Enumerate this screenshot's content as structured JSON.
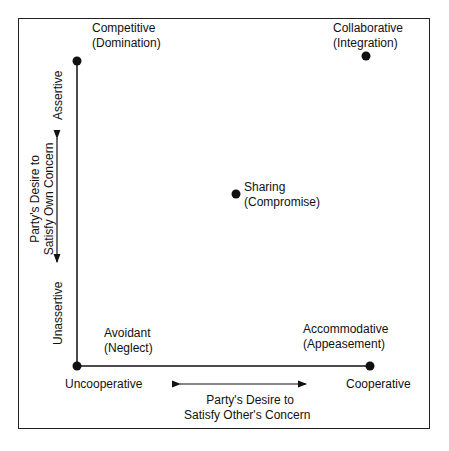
{
  "diagram": {
    "styles": [
      {
        "name": "Competitive",
        "sub": "(Domination)"
      },
      {
        "name": "Collaborative",
        "sub": "(Integration)"
      },
      {
        "name": "Sharing",
        "sub": "(Compromise)"
      },
      {
        "name": "Avoidant",
        "sub": "(Neglect)"
      },
      {
        "name": "Accommodative",
        "sub": "(Appeasement)"
      }
    ],
    "y_axis": {
      "high": "Assertive",
      "low": "Unassertive",
      "label_line1": "Party's Desire to",
      "label_line2": "Satisfy Own Concern"
    },
    "x_axis": {
      "low": "Uncooperative",
      "high": "Cooperative",
      "label_line1": "Party's Desire to",
      "label_line2": "Satisfy Other's Concern"
    }
  }
}
